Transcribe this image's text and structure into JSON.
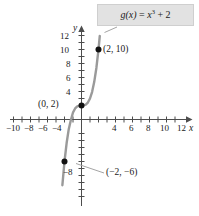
{
  "figure": {
    "title": "",
    "equation_label": {
      "text": "g(x) = x³ + 2",
      "fn_name": "g",
      "arg": "(x)",
      "equals": " = ",
      "base": "x",
      "exponent": "3",
      "tail": " + 2"
    },
    "axis_names": {
      "x": "x",
      "y": "y"
    }
  },
  "chart_data": {
    "type": "line",
    "title": "",
    "subtitle": "",
    "xlabel": "x",
    "ylabel": "y",
    "function": "g(x) = x^3 + 2",
    "grid": false,
    "legend": null,
    "xlim": [
      -12,
      13
    ],
    "ylim": [
      -11,
      13
    ],
    "x_ticks_labeled": [
      -10,
      -8,
      -6,
      -4,
      4,
      6,
      8,
      10,
      12
    ],
    "x_tick_labels": [
      "−10",
      "−8",
      "−6",
      "−4",
      "4",
      "6",
      "8",
      "10",
      "12"
    ],
    "x_ticks_all": [
      -11,
      -10,
      -9,
      -8,
      -7,
      -6,
      -5,
      -4,
      -3,
      -2,
      -1,
      1,
      2,
      3,
      4,
      5,
      6,
      7,
      8,
      9,
      10,
      11,
      12
    ],
    "y_ticks_labeled": [
      12,
      10,
      8,
      6,
      4,
      -8
    ],
    "y_tick_labels": [
      "12",
      "10",
      "8",
      "6",
      "4",
      "−8"
    ],
    "y_ticks_all": [
      12,
      11,
      10,
      9,
      8,
      7,
      6,
      5,
      4,
      3,
      2,
      1,
      -1,
      -2,
      -3,
      -4,
      -5,
      -6,
      -7,
      -8,
      -9,
      -10
    ],
    "series": [
      {
        "name": "g(x) = x^3 + 2",
        "color": "#9a9a9a",
        "x": [
          -2.25,
          -2.0,
          -1.75,
          -1.5,
          -1.25,
          -1.0,
          -0.75,
          -0.5,
          -0.25,
          0.0,
          0.25,
          0.5,
          0.75,
          1.0,
          1.25,
          1.5,
          1.75,
          2.0,
          2.15
        ],
        "y": [
          -9.39,
          -6.0,
          -3.36,
          -1.38,
          -0.08,
          1.0,
          1.58,
          1.88,
          1.98,
          2.0,
          2.02,
          2.13,
          2.42,
          3.0,
          3.95,
          5.38,
          7.36,
          10.0,
          11.94
        ]
      }
    ],
    "points": [
      {
        "name": "point-0-2",
        "label": "(0, 2)",
        "x": 0,
        "y": 2,
        "label_side": "left"
      },
      {
        "name": "point-2-10",
        "label": "(2, 10)",
        "x": 2,
        "y": 10,
        "label_side": "right"
      },
      {
        "name": "point-neg2-neg6",
        "label": "(−2, −6)",
        "x": -2,
        "y": -6,
        "label_side": "right-leader"
      }
    ],
    "annotations": [
      {
        "name": "equation-callout",
        "text": "g(x) = x³ + 2",
        "target_x": 2.1,
        "target_y": 11.8
      }
    ]
  },
  "colors": {
    "curve": "#9a9a9a",
    "axis": "#4d4d4d",
    "text": "#1a1a1a",
    "box_bg": "#e2e2e2",
    "box_border": "#cfcfcf",
    "leader": "#9a9a9a",
    "point": "#111111"
  }
}
